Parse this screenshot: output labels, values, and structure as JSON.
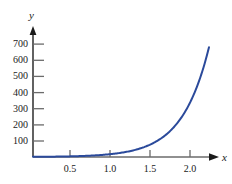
{
  "chart_data": {
    "type": "line",
    "title": "",
    "subtitle": "",
    "xlabel": "x",
    "ylabel": "y",
    "xlim": [
      0,
      2.35
    ],
    "ylim": [
      0,
      740
    ],
    "grid": false,
    "legend": null,
    "x_ticks": [
      {
        "value": 0.5,
        "label": "0.5"
      },
      {
        "value": 1.0,
        "label": "1.0"
      },
      {
        "value": 1.5,
        "label": "1.5"
      },
      {
        "value": 2.0,
        "label": "2.0"
      }
    ],
    "y_ticks": [
      {
        "value": 100,
        "label": "100"
      },
      {
        "value": 200,
        "label": "200"
      },
      {
        "value": 300,
        "label": "300"
      },
      {
        "value": 400,
        "label": "400"
      },
      {
        "value": 500,
        "label": "500"
      },
      {
        "value": 600,
        "label": "600"
      },
      {
        "value": 700,
        "label": "700"
      }
    ],
    "series": [
      {
        "name": "exponential-curve",
        "color": "#2b4a9b",
        "x": [
          0,
          0.1,
          0.2,
          0.3,
          0.4,
          0.5,
          0.6,
          0.7,
          0.8,
          0.9,
          1.0,
          1.1,
          1.2,
          1.3,
          1.4,
          1.5,
          1.6,
          1.7,
          1.8,
          1.9,
          2.0,
          2.1,
          2.2
        ],
        "y": [
          1,
          1.4,
          2.1,
          3.0,
          4.3,
          6.2,
          8.9,
          12.8,
          18.3,
          26.3,
          37.7,
          54.1,
          77.6,
          111.3,
          159.6,
          228.9,
          328.3,
          470.8,
          675.3,
          968.6,
          1389,
          1992,
          2857
        ],
        "y_plotted": [
          1,
          1.4,
          2.1,
          3.0,
          4.3,
          6.2,
          8.9,
          12.8,
          18.3,
          26.3,
          37.7,
          54.1,
          77.6,
          111.3,
          159.6,
          228.9,
          328.3,
          470.8,
          675.3
        ],
        "x_end": 2.2,
        "y_end": 680
      }
    ]
  },
  "axes": {
    "y_axis_name": "y",
    "x_axis_name": "x",
    "axis_color": "#3a3a3a",
    "tick_color": "#6b6b6b",
    "curve_color": "#2b4a9b",
    "background": "#ffffff"
  }
}
